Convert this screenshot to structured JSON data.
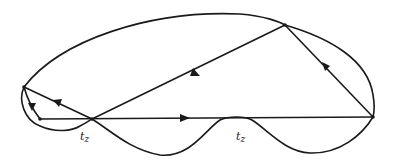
{
  "diagram": {
    "type": "graph-with-directed-edges",
    "stroke_color": "#1a1a1a",
    "background": "#ffffff",
    "vertices": [
      {
        "id": "A",
        "x": 24,
        "y": 87
      },
      {
        "id": "B",
        "x": 40,
        "y": 119
      },
      {
        "id": "C",
        "x": 92,
        "y": 119
      },
      {
        "id": "D",
        "x": 285,
        "y": 25
      },
      {
        "id": "E",
        "x": 373,
        "y": 117
      }
    ],
    "edges": [
      {
        "id": "outer-arc",
        "from": "A",
        "to": "E",
        "via": "D",
        "directed": false
      },
      {
        "id": "A-B",
        "from": "A",
        "to": "B",
        "directed": true,
        "arrow": "down"
      },
      {
        "id": "C-A",
        "from": "C",
        "to": "A",
        "directed": true,
        "arrow": "toward-A"
      },
      {
        "id": "B-E",
        "from": "B",
        "to": "E",
        "directed": true,
        "arrow": "right"
      },
      {
        "id": "D-C",
        "from": "D",
        "to": "C",
        "directed": true,
        "arrow": "toward-C"
      },
      {
        "id": "E-D",
        "from": "E",
        "to": "D",
        "directed": true,
        "arrow": "toward-D"
      },
      {
        "id": "A-C-loop",
        "from": "A",
        "to": "C",
        "directed": false
      },
      {
        "id": "wavy-bottom",
        "from": "C",
        "to": "E",
        "directed": false
      }
    ],
    "labels": [
      {
        "id": "label-1",
        "base": "t",
        "sub": "z",
        "x": 80,
        "y": 131
      },
      {
        "id": "label-2",
        "base": "t",
        "sub": "z",
        "x": 236,
        "y": 131
      }
    ]
  }
}
